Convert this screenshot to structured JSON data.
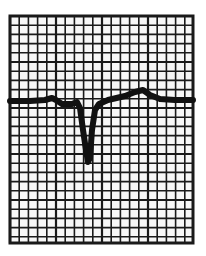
{
  "figure": {
    "grid": {
      "left": 10,
      "top": 16,
      "right": 193,
      "bottom": 243,
      "cell": 9.2,
      "line_color": "#1a1a1a",
      "border_color": "#1a1a1a",
      "background": "#f7f7f7"
    },
    "trace": {
      "color": "#111111",
      "width": 6,
      "points": [
        [
          10,
          101
        ],
        [
          30,
          101
        ],
        [
          45,
          100
        ],
        [
          52,
          98
        ],
        [
          56,
          100
        ],
        [
          62,
          104
        ],
        [
          72,
          104
        ],
        [
          77,
          102
        ],
        [
          80,
          108
        ],
        [
          83,
          130
        ],
        [
          86,
          150
        ],
        [
          88,
          162
        ],
        [
          90,
          158
        ],
        [
          92,
          130
        ],
        [
          95,
          110
        ],
        [
          99,
          104
        ],
        [
          108,
          100
        ],
        [
          125,
          96
        ],
        [
          135,
          92
        ],
        [
          143,
          90
        ],
        [
          150,
          95
        ],
        [
          160,
          99
        ],
        [
          175,
          100
        ],
        [
          193,
          100
        ]
      ]
    }
  }
}
